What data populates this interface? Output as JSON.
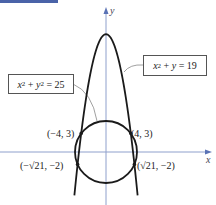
{
  "figure": {
    "axes": {
      "x_label": "x",
      "y_label": "y",
      "axis_color": "#7b8fc4",
      "origin_px": [
        106,
        152
      ],
      "scale_px_per_unit": 6.2
    },
    "curves": [
      {
        "name": "parabola",
        "equation_label": "x² + y = 19",
        "equation_parts": {
          "lhs1": "x",
          "exp": "2",
          "mid": " + ",
          "lhs2": "y",
          "rhs": " = 19"
        }
      },
      {
        "name": "circle",
        "equation_label": "x² + y² = 25",
        "equation_parts": {
          "lhs1": "x",
          "exp1": "2",
          "mid": " + ",
          "lhs2": "y",
          "exp2": "2",
          "rhs": " = 25"
        }
      }
    ],
    "points": [
      {
        "label": "(−4, 3)",
        "x": -4,
        "y": 3
      },
      {
        "label": "(4, 3)",
        "x": 4,
        "y": 3
      },
      {
        "label": "(−√21, −2)",
        "x": -4.583,
        "y": -2
      },
      {
        "label": "(√21, −2)",
        "x": 4.583,
        "y": -2
      }
    ],
    "colors": {
      "curve": "#1a1a1a",
      "header_bar": "#4a63a8"
    }
  }
}
